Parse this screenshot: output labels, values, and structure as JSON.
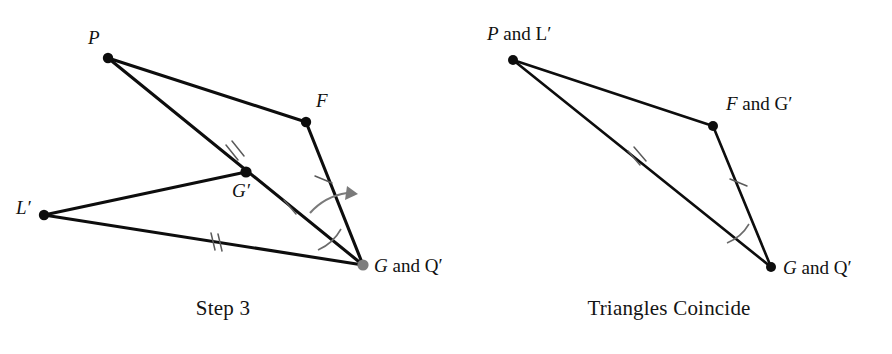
{
  "page": {
    "width": 892,
    "height": 354,
    "background": "#ffffff",
    "ink": "#0d0d0d",
    "mark_gray": "#6b6b6b",
    "coincide_dot_gray": "#7d7d7d"
  },
  "panels": [
    {
      "id": "step-3",
      "caption": "Step 3",
      "vertices": [
        {
          "name": "P",
          "label_plain": "P",
          "label_italic": "P",
          "label_rest": "",
          "x": 108,
          "y": 58,
          "lx": 88,
          "ly": 44,
          "dot": "black"
        },
        {
          "name": "F",
          "label_plain": "F",
          "label_italic": "F",
          "label_rest": "",
          "x": 306,
          "y": 122,
          "lx": 316,
          "ly": 107,
          "dot": "black"
        },
        {
          "name": "L-prime",
          "label_plain": "L′",
          "label_italic": "L′",
          "label_rest": "",
          "x": 44,
          "y": 215,
          "lx": 16,
          "ly": 214,
          "dot": "black"
        },
        {
          "name": "G-prime",
          "label_plain": "G′",
          "label_italic": "G′",
          "label_rest": "",
          "x": 246,
          "y": 172,
          "lx": 232,
          "ly": 197,
          "dot": "black"
        },
        {
          "name": "G-and-Q-prime",
          "label_plain": "G and Q′",
          "label_italic": "G",
          "label_rest": " and Q′",
          "x": 363,
          "y": 265,
          "lx": 374,
          "ly": 272,
          "dot": "gray"
        }
      ],
      "edges": [
        {
          "name": "edge-P-F",
          "from": "P",
          "to": "F"
        },
        {
          "name": "edge-F-G",
          "from": "F",
          "to": "G and Q′"
        },
        {
          "name": "edge-P-G",
          "from": "P",
          "to": "G and Q′"
        },
        {
          "name": "edge-Lp-Gp",
          "from": "L′",
          "to": "G′"
        },
        {
          "name": "edge-Lp-G",
          "from": "L′",
          "to": "G and Q′"
        }
      ],
      "tick_marks": [
        {
          "name": "tick-double-P-Gprime",
          "count": 2,
          "segment": "P–G′",
          "x": 234,
          "y": 157
        },
        {
          "name": "tick-single-Gprime-G",
          "count": 1,
          "segment": "G′–G",
          "x": 290,
          "y": 207
        },
        {
          "name": "tick-double-Lprime-G",
          "count": 2,
          "segment": "L′–G",
          "x": 216,
          "y": 241
        },
        {
          "name": "tick-single-F-G",
          "count": 1,
          "segment": "F–G",
          "x": 323,
          "y": 180
        }
      ],
      "angle_marks": [
        {
          "name": "angle-arc-at-G",
          "vertex": "G and Q′"
        }
      ],
      "rotation_arrow": {
        "name": "rotation-arrow",
        "from_ray": "G′G",
        "to_ray": "FG",
        "direction": "counterclockwise"
      }
    },
    {
      "id": "triangles-coincide",
      "caption": "Triangles Coincide",
      "vertices": [
        {
          "name": "P-and-L-prime",
          "label_plain": "P and L′",
          "label_italic": "P",
          "label_rest": " and L′",
          "x": 513,
          "y": 60,
          "lx": 487,
          "ly": 40,
          "dot": "black"
        },
        {
          "name": "F-and-G-prime",
          "label_plain": "F and G′",
          "label_italic": "F",
          "label_rest": " and G′",
          "x": 713,
          "y": 126,
          "lx": 726,
          "ly": 110,
          "dot": "black"
        },
        {
          "name": "G-and-Q-prime",
          "label_plain": "G and Q′",
          "label_italic": "G",
          "label_rest": " and Q′",
          "x": 771,
          "y": 267,
          "lx": 783,
          "ly": 274,
          "dot": "black"
        }
      ],
      "edges": [
        {
          "name": "edge-PL-FG",
          "from": "P and L′",
          "to": "F and G′"
        },
        {
          "name": "edge-FG-GQ",
          "from": "F and G′",
          "to": "G and Q′"
        },
        {
          "name": "edge-PL-GQ",
          "from": "P and L′",
          "to": "G and Q′"
        }
      ],
      "tick_marks": [
        {
          "name": "tick-double-PL-GQ",
          "count": 2,
          "segment": "P–G",
          "x": 636,
          "y": 162
        },
        {
          "name": "tick-single-FG-GQ",
          "count": 1,
          "segment": "F–G",
          "x": 738,
          "y": 183
        }
      ],
      "angle_marks": [
        {
          "name": "angle-arc-at-G",
          "vertex": "G and Q′"
        }
      ]
    }
  ]
}
